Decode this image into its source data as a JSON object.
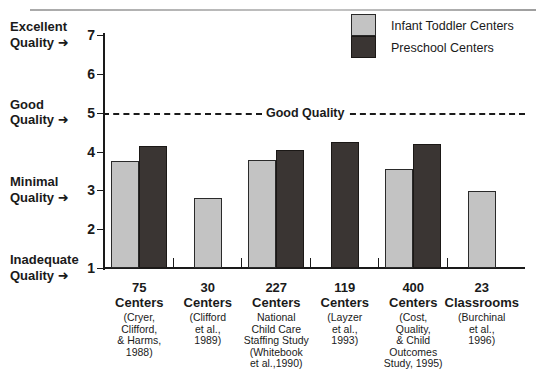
{
  "chart_data": {
    "type": "bar",
    "title": "",
    "xlabel": "",
    "ylabel": "",
    "ylim": [
      1,
      7
    ],
    "grid": false,
    "y_ticks": [
      1,
      2,
      3,
      4,
      5,
      6,
      7
    ],
    "y_tick_labels": [
      "1",
      "2",
      "3",
      "4",
      "5",
      "6",
      "7"
    ],
    "legend_position": "top-right",
    "categories": [
      "75 Centers",
      "30 Centers",
      "227 Centers",
      "119 Centers",
      "400 Centers",
      "23 Classrooms"
    ],
    "series": [
      {
        "name": "Infant Toddler Centers",
        "color": "#c3c3c3",
        "values": [
          3.75,
          2.8,
          3.78,
          null,
          3.55,
          2.98
        ]
      },
      {
        "name": "Preschool Centers",
        "color": "#3a3533",
        "values": [
          4.15,
          null,
          4.03,
          4.25,
          4.2,
          null
        ]
      }
    ],
    "reference_line": {
      "value": 5,
      "label": "Good Quality",
      "style": "dashed"
    },
    "y_axis_annotations": [
      {
        "value": 7,
        "line1": "Excellent",
        "line2": "Quality"
      },
      {
        "value": 5,
        "line1": "Good",
        "line2": "Quality"
      },
      {
        "value": 3,
        "line1": "Minimal",
        "line2": "Quality"
      },
      {
        "value": 1,
        "line1": "Inadequate",
        "line2": "Quality"
      }
    ],
    "x_tick_captions": [
      {
        "count": "75",
        "unit": "Centers",
        "cite": "(Cryer,\nClifford,\n& Harms,\n1988)"
      },
      {
        "count": "30",
        "unit": "Centers",
        "cite": "(Clifford\net al.,\n1989)"
      },
      {
        "count": "227",
        "unit": "Centers",
        "cite": "National\nChild Care\nStaffing Study\n(Whitebook\net al.,1990)"
      },
      {
        "count": "119",
        "unit": "Centers",
        "cite": "(Layzer\net al.,\n1993)"
      },
      {
        "count": "400",
        "unit": "Centers",
        "cite": "(Cost,\nQuality,\n& Child\nOutcomes\nStudy, 1995)"
      },
      {
        "count": "23",
        "unit": "Classrooms",
        "cite": "(Burchinal\net al.,\n1996)"
      }
    ]
  },
  "legend": {
    "items": [
      {
        "label": "Infant Toddler Centers",
        "color": "#c3c3c3"
      },
      {
        "label": "Preschool Centers",
        "color": "#3a3533"
      }
    ]
  },
  "arrow_glyph": "➤"
}
